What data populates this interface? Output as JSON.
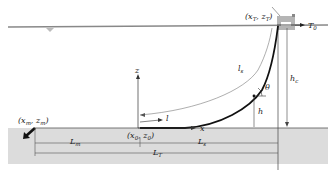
{
  "diagram": {
    "type": "catenary-mooring-line-schematic",
    "labels": {
      "top_point": "(x",
      "top_point_sub": "T",
      "top_point_z": ", z",
      "top_point_close": ")",
      "tension": "T",
      "tension_sub": "0",
      "suspended_length": "l",
      "suspended_length_sub": "s",
      "angle": "θ",
      "height": "h",
      "height_total": "h",
      "height_total_sub": "c",
      "z_axis": "z",
      "x_axis": "x",
      "arc_length": "l",
      "origin": "(x",
      "origin_sub": "0",
      "origin_z": ", z",
      "origin_close": ")",
      "anchor": "(x",
      "anchor_sub": "m",
      "anchor_z": ", z",
      "anchor_close": ")",
      "L_m": "L",
      "L_m_sub": "m",
      "L_s": "L",
      "L_s_sub": "s",
      "L_T": "L",
      "L_T_sub": "T"
    },
    "colors": {
      "seabed": "#dcdcdc",
      "water_line": "#888888",
      "line": "#111111",
      "vessel": "#b5b5b5",
      "text": "#222222"
    }
  }
}
